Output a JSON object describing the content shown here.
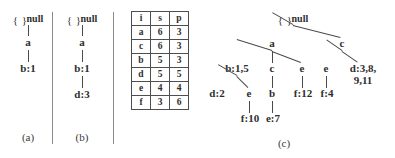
{
  "figure": {
    "panels": [
      {
        "id": "a",
        "caption": "(a)",
        "root_label": "{ }",
        "root_suffix": "null",
        "nodes": [
          {
            "label": "a"
          },
          {
            "label": "b:1"
          }
        ]
      },
      {
        "id": "b",
        "caption": "(b)",
        "root_label": "{ }",
        "root_suffix": "null",
        "nodes": [
          {
            "label": "a"
          },
          {
            "label": "b:1"
          },
          {
            "label": "d:3"
          }
        ]
      },
      {
        "id": "c",
        "caption": "(c)",
        "root_label": "{ }",
        "root_suffix": "null",
        "nodes": [
          {
            "label": "a"
          },
          {
            "label": "c"
          },
          {
            "label": "b:1,5"
          },
          {
            "label": "c"
          },
          {
            "label": "e"
          },
          {
            "label": "e"
          },
          {
            "label": "d:3,8,"
          },
          {
            "label": "9,11"
          },
          {
            "label": "d:2"
          },
          {
            "label": "e"
          },
          {
            "label": "b"
          },
          {
            "label": "f:12"
          },
          {
            "label": "f:4"
          },
          {
            "label": "f:10"
          },
          {
            "label": "e:7"
          }
        ]
      }
    ],
    "header_table": {
      "columns": [
        "i",
        "s",
        "p"
      ],
      "rows": [
        [
          "a",
          "6",
          "3"
        ],
        [
          "c",
          "6",
          "3"
        ],
        [
          "b",
          "5",
          "3"
        ],
        [
          "d",
          "5",
          "5"
        ],
        [
          "e",
          "4",
          "4"
        ],
        [
          "f",
          "3",
          "6"
        ]
      ]
    }
  }
}
